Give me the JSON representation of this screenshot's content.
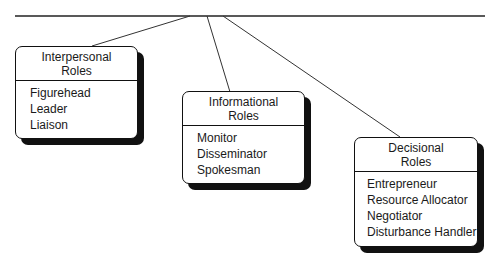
{
  "diagram": {
    "boxes": [
      {
        "title_line1": "Interpersonal",
        "title_line2": "Roles",
        "items": [
          "Figurehead",
          "Leader",
          "Liaison"
        ]
      },
      {
        "title_line1": "Informational",
        "title_line2": "Roles",
        "items": [
          "Monitor",
          "Disseminator",
          "Spokesman"
        ]
      },
      {
        "title_line1": "Decisional",
        "title_line2": "Roles",
        "items": [
          "Entrepreneur",
          "Resource Allocator",
          "Negotiator",
          "Disturbance Handler"
        ]
      }
    ]
  }
}
